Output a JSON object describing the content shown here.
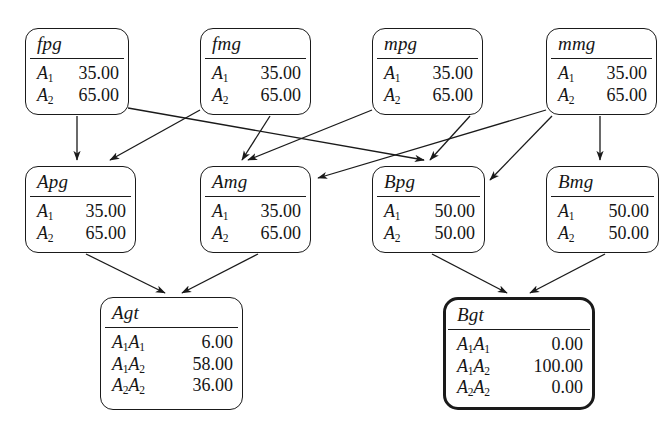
{
  "diagram": {
    "stroke_color": "#1a1a1a",
    "background_color": "#ffffff",
    "nodes": [
      {
        "id": "fpg",
        "label": "fpg",
        "x": 25,
        "y": 28,
        "w": 104,
        "h": 87,
        "bold": false,
        "rows": [
          {
            "allele": "A",
            "sub": "1",
            "value": "35.00"
          },
          {
            "allele": "A",
            "sub": "2",
            "value": "65.00"
          }
        ]
      },
      {
        "id": "fmg",
        "label": "fmg",
        "x": 200,
        "y": 28,
        "w": 111,
        "h": 87,
        "bold": false,
        "rows": [
          {
            "allele": "A",
            "sub": "1",
            "value": "35.00"
          },
          {
            "allele": "A",
            "sub": "2",
            "value": "65.00"
          }
        ]
      },
      {
        "id": "mpg",
        "label": "mpg",
        "x": 372,
        "y": 28,
        "w": 111,
        "h": 87,
        "bold": false,
        "rows": [
          {
            "allele": "A",
            "sub": "1",
            "value": "35.00"
          },
          {
            "allele": "A",
            "sub": "2",
            "value": "65.00"
          }
        ]
      },
      {
        "id": "mmg",
        "label": "mmg",
        "x": 546,
        "y": 28,
        "w": 111,
        "h": 87,
        "bold": false,
        "rows": [
          {
            "allele": "A",
            "sub": "1",
            "value": "35.00"
          },
          {
            "allele": "A",
            "sub": "2",
            "value": "65.00"
          }
        ]
      },
      {
        "id": "Apg",
        "label": "Apg",
        "x": 25,
        "y": 166,
        "w": 111,
        "h": 87,
        "bold": false,
        "rows": [
          {
            "allele": "A",
            "sub": "1",
            "value": "35.00"
          },
          {
            "allele": "A",
            "sub": "2",
            "value": "65.00"
          }
        ]
      },
      {
        "id": "Amg",
        "label": "Amg",
        "x": 200,
        "y": 166,
        "w": 111,
        "h": 87,
        "bold": false,
        "rows": [
          {
            "allele": "A",
            "sub": "1",
            "value": "35.00"
          },
          {
            "allele": "A",
            "sub": "2",
            "value": "65.00"
          }
        ]
      },
      {
        "id": "Bpg",
        "label": "Bpg",
        "x": 372,
        "y": 166,
        "w": 113,
        "h": 87,
        "bold": false,
        "rows": [
          {
            "allele": "A",
            "sub": "1",
            "value": "50.00"
          },
          {
            "allele": "A",
            "sub": "2",
            "value": "50.00"
          }
        ]
      },
      {
        "id": "Bmg",
        "label": "Bmg",
        "x": 546,
        "y": 166,
        "w": 113,
        "h": 87,
        "bold": false,
        "rows": [
          {
            "allele": "A",
            "sub": "1",
            "value": "50.00"
          },
          {
            "allele": "A",
            "sub": "2",
            "value": "50.00"
          }
        ]
      },
      {
        "id": "Agt",
        "label": "Agt",
        "x": 100,
        "y": 297,
        "w": 143,
        "h": 113,
        "bold": false,
        "rows": [
          {
            "allele": "A",
            "sub": "1",
            "allele2": "A",
            "sub2": "1",
            "value": "6.00"
          },
          {
            "allele": "A",
            "sub": "1",
            "allele2": "A",
            "sub2": "2",
            "value": "58.00"
          },
          {
            "allele": "A",
            "sub": "2",
            "allele2": "A",
            "sub2": "2",
            "value": "36.00"
          }
        ]
      },
      {
        "id": "Bgt",
        "label": "Bgt",
        "x": 443,
        "y": 297,
        "w": 152,
        "h": 113,
        "bold": true,
        "rows": [
          {
            "allele": "A",
            "sub": "1",
            "allele2": "A",
            "sub2": "1",
            "value": "0.00"
          },
          {
            "allele": "A",
            "sub": "1",
            "allele2": "A",
            "sub2": "2",
            "value": "100.00"
          },
          {
            "allele": "A",
            "sub": "2",
            "allele2": "A",
            "sub2": "2",
            "value": "0.00"
          }
        ]
      }
    ],
    "edges": [
      {
        "from": "fpg",
        "to": "Apg",
        "path": "M 77,116 L 77,160"
      },
      {
        "from": "fpg",
        "to": "Bpg",
        "path": "M 128,108 L 424,160"
      },
      {
        "from": "fmg",
        "to": "Apg",
        "path": "M 200,110 L 110,160"
      },
      {
        "from": "fmg",
        "to": "Amg",
        "path": "M 270,116 L 242,160"
      },
      {
        "from": "mpg",
        "to": "Amg",
        "path": "M 372,110 L 248,160"
      },
      {
        "from": "mpg",
        "to": "Bpg",
        "path": "M 470,116 L 430,160"
      },
      {
        "from": "mmg",
        "to": "Amg",
        "path": "M 546,110 L 318,178"
      },
      {
        "from": "mmg",
        "to": "Bpg",
        "path": "M 552,116 L 490,180"
      },
      {
        "from": "mmg",
        "to": "Bmg",
        "path": "M 600,116 L 600,160"
      },
      {
        "from": "Apg",
        "to": "Agt",
        "path": "M 86,254 L 165,293"
      },
      {
        "from": "Amg",
        "to": "Agt",
        "path": "M 258,254 L 182,293"
      },
      {
        "from": "Bpg",
        "to": "Bgt",
        "path": "M 432,254 L 507,293"
      },
      {
        "from": "Bmg",
        "to": "Bgt",
        "path": "M 605,254 L 530,293"
      }
    ]
  }
}
